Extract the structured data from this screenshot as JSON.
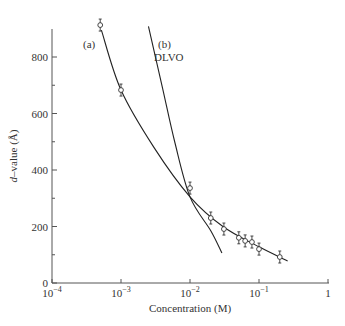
{
  "chart_data": {
    "type": "scatter",
    "title": "",
    "xlabel": "Concentration (M)",
    "ylabel_italic": "d",
    "ylabel_rest": "–value (Å)",
    "ylabel": "d–value (Å)",
    "xscale": "log",
    "xlim": [
      0.0001,
      1
    ],
    "ylim": [
      0,
      900
    ],
    "grid": false,
    "x_ticks": [
      {
        "value": 0.0001,
        "base": "10",
        "exp": "−4"
      },
      {
        "value": 0.001,
        "base": "10",
        "exp": "−3"
      },
      {
        "value": 0.01,
        "base": "10",
        "exp": "−2"
      },
      {
        "value": 0.1,
        "base": "10",
        "exp": "−1"
      },
      {
        "value": 1,
        "base": "1",
        "exp": ""
      }
    ],
    "y_ticks": [
      0,
      200,
      400,
      600,
      800
    ],
    "y_minor_ticks": [
      100,
      300,
      500,
      700
    ],
    "series": [
      {
        "name": "(a)",
        "label": "(a)",
        "kind": "data_with_fit",
        "points": [
          {
            "x": 0.0005,
            "y": 913
          },
          {
            "x": 0.001,
            "y": 683
          },
          {
            "x": 0.01,
            "y": 336
          },
          {
            "x": 0.02,
            "y": 230
          },
          {
            "x": 0.031,
            "y": 191
          },
          {
            "x": 0.051,
            "y": 160
          },
          {
            "x": 0.063,
            "y": 149
          },
          {
            "x": 0.079,
            "y": 145
          },
          {
            "x": 0.1,
            "y": 120
          },
          {
            "x": 0.2,
            "y": 92
          }
        ],
        "fit_curve": [
          {
            "x": 0.00052,
            "y": 895
          },
          {
            "x": 0.001,
            "y": 683
          },
          {
            "x": 0.003,
            "y": 480
          },
          {
            "x": 0.01,
            "y": 305
          },
          {
            "x": 0.03,
            "y": 200
          },
          {
            "x": 0.1,
            "y": 128
          },
          {
            "x": 0.26,
            "y": 78
          }
        ]
      },
      {
        "name": "(b) DLVO",
        "label_line1": "(b)",
        "label_line2": "DLVO",
        "kind": "theory_curve",
        "fit_curve": [
          {
            "x": 0.0025,
            "y": 908
          },
          {
            "x": 0.004,
            "y": 690
          },
          {
            "x": 0.006,
            "y": 500
          },
          {
            "x": 0.01,
            "y": 305
          },
          {
            "x": 0.02,
            "y": 185
          },
          {
            "x": 0.029,
            "y": 106
          }
        ]
      }
    ]
  },
  "labels": {
    "curve_a": "(a)",
    "curve_b_line1": "(b)",
    "curve_b_line2": "DLVO"
  }
}
